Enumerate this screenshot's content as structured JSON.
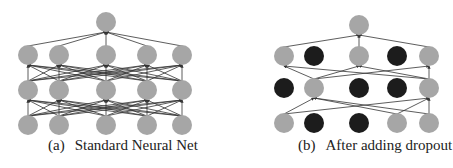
{
  "colors": {
    "active_node": "#a6a6a6",
    "dropped_node": "#1c1c1c",
    "edge": "#333333",
    "background": "#ffffff"
  },
  "panels": [
    {
      "id": "a",
      "label": "(a)",
      "title": "Standard Neural Net",
      "layers": [
        {
          "name": "output",
          "y": 22,
          "nodes": [
            {
              "x": 106,
              "dropped": false
            }
          ]
        },
        {
          "name": "hidden2",
          "y": 55,
          "nodes": [
            {
              "x": 28,
              "dropped": false
            },
            {
              "x": 59,
              "dropped": false
            },
            {
              "x": 106,
              "dropped": false
            },
            {
              "x": 147,
              "dropped": false
            },
            {
              "x": 182,
              "dropped": false
            }
          ]
        },
        {
          "name": "hidden1",
          "y": 90,
          "nodes": [
            {
              "x": 28,
              "dropped": false
            },
            {
              "x": 59,
              "dropped": false
            },
            {
              "x": 106,
              "dropped": false
            },
            {
              "x": 147,
              "dropped": false
            },
            {
              "x": 182,
              "dropped": false
            }
          ]
        },
        {
          "name": "input",
          "y": 125,
          "nodes": [
            {
              "x": 28,
              "dropped": false
            },
            {
              "x": 59,
              "dropped": false
            },
            {
              "x": 106,
              "dropped": false
            },
            {
              "x": 147,
              "dropped": false
            },
            {
              "x": 182,
              "dropped": false
            }
          ]
        }
      ]
    },
    {
      "id": "b",
      "label": "(b)",
      "title": "After adding dropout",
      "layers": [
        {
          "name": "output",
          "y": 25,
          "nodes": [
            {
              "x": 359,
              "dropped": false
            }
          ]
        },
        {
          "name": "hidden2",
          "y": 56,
          "nodes": [
            {
              "x": 284,
              "dropped": false
            },
            {
              "x": 314,
              "dropped": true
            },
            {
              "x": 359,
              "dropped": false
            },
            {
              "x": 397,
              "dropped": true
            },
            {
              "x": 429,
              "dropped": false
            }
          ]
        },
        {
          "name": "hidden1",
          "y": 88,
          "nodes": [
            {
              "x": 284,
              "dropped": true
            },
            {
              "x": 314,
              "dropped": false
            },
            {
              "x": 359,
              "dropped": true
            },
            {
              "x": 397,
              "dropped": true
            },
            {
              "x": 429,
              "dropped": false
            }
          ]
        },
        {
          "name": "input",
          "y": 123,
          "nodes": [
            {
              "x": 284,
              "dropped": false
            },
            {
              "x": 314,
              "dropped": true
            },
            {
              "x": 359,
              "dropped": true
            },
            {
              "x": 397,
              "dropped": false
            },
            {
              "x": 429,
              "dropped": false
            }
          ]
        }
      ]
    }
  ],
  "node_radius": 10
}
